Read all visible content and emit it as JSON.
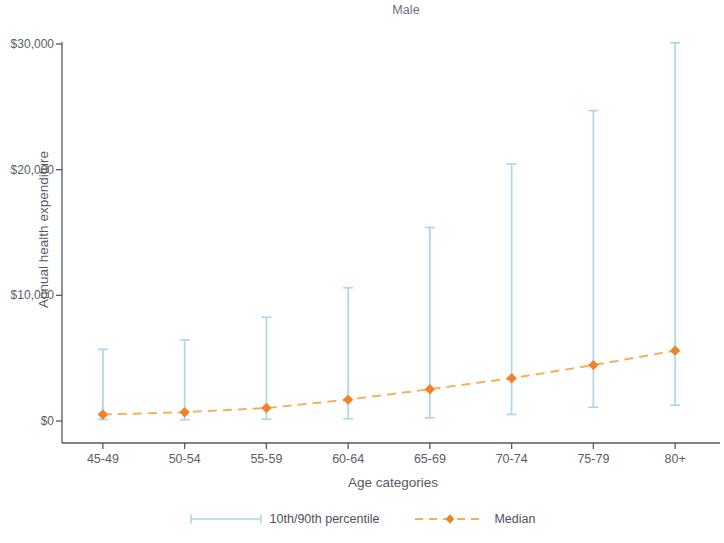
{
  "chart_data": {
    "type": "line",
    "title": "Male",
    "xlabel": "Age categories",
    "ylabel": "Annual health expenditure",
    "categories": [
      "45-49",
      "50-54",
      "55-59",
      "60-64",
      "65-69",
      "70-74",
      "75-79",
      "80+"
    ],
    "ylim": [
      0,
      30000
    ],
    "ytick_values": [
      0,
      10000,
      20000,
      30000
    ],
    "ytick_labels": [
      "$0",
      "$10,000",
      "$20,000",
      "$30,000"
    ],
    "grid": false,
    "legend_position": "bottom-center",
    "series": [
      {
        "name": "10th/90th percentile",
        "type": "errorbar",
        "color": "#add7e8",
        "p10": [
          120,
          100,
          150,
          180,
          250,
          520,
          1100,
          1250
        ],
        "p90": [
          5700,
          6450,
          8250,
          10600,
          15400,
          20450,
          24700,
          30100
        ]
      },
      {
        "name": "Median",
        "type": "line-marker",
        "color": "#f59337",
        "style": "dashed",
        "marker": "diamond",
        "values": [
          520,
          700,
          1030,
          1700,
          2530,
          3400,
          4450,
          5600
        ]
      }
    ]
  },
  "legend": {
    "entries": [
      {
        "label": "10th/90th percentile"
      },
      {
        "label": "Median"
      }
    ]
  },
  "axes": {
    "y_title": "Annual health expenditure",
    "x_title": "Age categories"
  }
}
